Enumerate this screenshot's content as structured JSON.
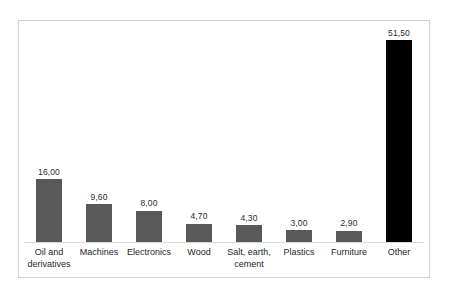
{
  "chart_data": {
    "type": "bar",
    "title": "",
    "subtitle": "",
    "xlabel": "",
    "ylabel": "",
    "grid": false,
    "legend": false,
    "axis": {
      "y_visible": false,
      "x_axis_line": true,
      "ylim": [
        0,
        51.5
      ]
    },
    "decimal_separator": ",",
    "categories": [
      "Oil and derivatives",
      "Machines",
      "Electronics",
      "Wood",
      "Salt, earth, cement",
      "Plastics",
      "Furniture",
      "Other"
    ],
    "values": [
      16.0,
      9.6,
      8.0,
      4.7,
      4.3,
      3.0,
      2.9,
      51.5
    ],
    "value_labels": [
      "16,00",
      "9,60",
      "8,00",
      "4,70",
      "4,30",
      "3,00",
      "2,90",
      "51,50"
    ],
    "bars": [
      {
        "category": "Oil and derivatives",
        "category_lines": [
          "Oil and",
          "derivatives"
        ],
        "value": 16.0,
        "label": "16,00",
        "color": "#595959"
      },
      {
        "category": "Machines",
        "category_lines": [
          "Machines"
        ],
        "value": 9.6,
        "label": "9,60",
        "color": "#595959"
      },
      {
        "category": "Electronics",
        "category_lines": [
          "Electronics"
        ],
        "value": 8.0,
        "label": "8,00",
        "color": "#595959"
      },
      {
        "category": "Wood",
        "category_lines": [
          "Wood"
        ],
        "value": 4.7,
        "label": "4,70",
        "color": "#595959"
      },
      {
        "category": "Salt, earth, cement",
        "category_lines": [
          "Salt, earth,",
          "cement"
        ],
        "value": 4.3,
        "label": "4,30",
        "color": "#595959"
      },
      {
        "category": "Plastics",
        "category_lines": [
          "Plastics"
        ],
        "value": 3.0,
        "label": "3,00",
        "color": "#595959"
      },
      {
        "category": "Furniture",
        "category_lines": [
          "Furniture"
        ],
        "value": 2.9,
        "label": "2,90",
        "color": "#595959"
      },
      {
        "category": "Other",
        "category_lines": [
          "Other"
        ],
        "value": 51.5,
        "label": "51,50",
        "color": "#000000"
      }
    ],
    "colors": {
      "bar_default": "#595959",
      "bar_accent": "#000000",
      "axis_line": "#d9d9d9",
      "frame_border": "#d4d4d4",
      "background": "#ffffff",
      "text": "#262626"
    }
  }
}
